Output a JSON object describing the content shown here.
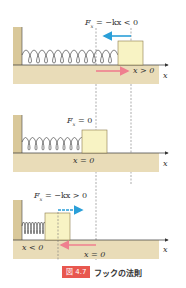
{
  "colors": {
    "floor": "#e9dcb8",
    "wall": "#d9c89a",
    "block_fill": "#f8f3c4",
    "block_stroke": "#8a7a4a",
    "force_arrow": "#2a9fd8",
    "displacement_arrow": "#ef7f8f",
    "badge": "#e8574f"
  },
  "panels": [
    {
      "force_label": "F_x = −kx < 0",
      "force_label_main": "F",
      "force_label_sub": "x",
      "force_label_rest": " = −kx < 0",
      "position_label": "x > 0",
      "axis_label": "x"
    },
    {
      "force_label_main": "F",
      "force_label_sub": "x",
      "force_label_rest": " = 0",
      "position_label": "x = 0",
      "axis_label": "x"
    },
    {
      "force_label_main": "F",
      "force_label_sub": "x",
      "force_label_rest": " = −kx > 0",
      "position_label": "x < 0",
      "origin_label": "x = 0",
      "axis_label": "x"
    }
  ],
  "caption": {
    "badge": "図 4.7",
    "title": "フックの法則"
  }
}
